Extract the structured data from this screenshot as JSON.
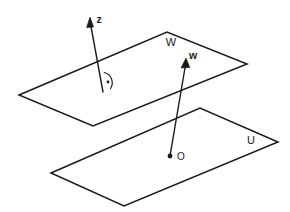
{
  "figure": {
    "kind": "geometry-diagram",
    "background_color": "#ffffff",
    "stroke_color": "#1a1a1a",
    "watermark": ""
  },
  "planes": [
    {
      "id": "plane-w",
      "label": "W",
      "label_x": 171,
      "label_y": 43,
      "points": "19,95 167,32 247,64 93,126"
    },
    {
      "id": "plane-u",
      "label": "U",
      "label_x": 251,
      "label_y": 141,
      "points": "51,173 200,108 278,142 124,206"
    }
  ],
  "vectors": [
    {
      "id": "vector-z",
      "label": "z",
      "label_x": 99,
      "label_y": 20,
      "tail_x": 103,
      "tail_y": 92,
      "tip_x": 90,
      "tip_y": 21,
      "head_points": "90,17 86.6,27.5 93.6,27.0",
      "normal_to": "W"
    },
    {
      "id": "vector-w",
      "label": "w",
      "label_x": 193,
      "label_y": 56,
      "tail_x": 170,
      "tail_y": 156,
      "tip_x": 186,
      "tip_y": 62,
      "head_points": "186,58 181.0,68.0 189.8,67.5",
      "origin": "O"
    }
  ],
  "points": [
    {
      "id": "point-o",
      "label": "O",
      "x": 170,
      "y": 156,
      "label_x": 181,
      "label_y": 157,
      "radius": 2.4
    }
  ],
  "angle_markers": [
    {
      "id": "right-angle-marker",
      "meaning": "perpendicular",
      "arc_path": "M 104.2 72.5 A 10.5 10.5 0 0 1 110.5 88.5",
      "dot_x": 108,
      "dot_y": 82,
      "dot_radius": 1.4
    }
  ]
}
